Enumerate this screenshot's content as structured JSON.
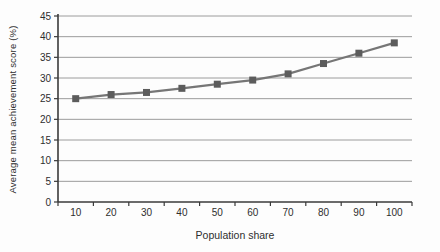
{
  "chart_data": {
    "type": "line",
    "title": "",
    "xlabel": "Population share",
    "ylabel": "Average mean achievement score (%)",
    "x": [
      10,
      20,
      30,
      40,
      50,
      60,
      70,
      80,
      90,
      100
    ],
    "series": [
      {
        "name": "Average mean achievement score (%)",
        "values": [
          25,
          26,
          26.5,
          27.5,
          28.5,
          29.5,
          31,
          33.5,
          36,
          38.5
        ]
      }
    ],
    "ylim": [
      0,
      45
    ],
    "yticks": [
      0,
      5,
      10,
      15,
      20,
      25,
      30,
      35,
      40,
      45
    ],
    "grid": "horizontal",
    "legend_position": "none",
    "marker": "square",
    "colors": {
      "line": "#767676",
      "marker": "#5c5c5c",
      "gridline": "#9c9c9c",
      "axis": "#3a3a3a",
      "tick_text": "#2e2e2e",
      "background": "#fdfdfd"
    }
  }
}
